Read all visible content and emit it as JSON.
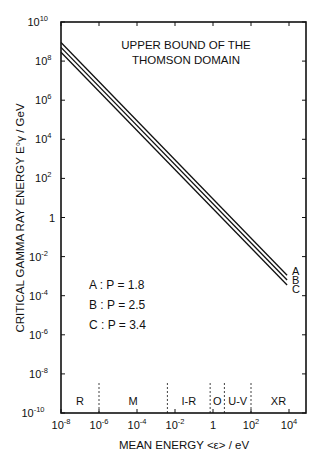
{
  "chart_data": {
    "type": "line",
    "title": "UPPER BOUND OF THE THOMSON DOMAIN",
    "title_lines": [
      "UPPER BOUND OF THE",
      "THOMSON DOMAIN"
    ],
    "xlabel": "MEAN ENERGY <ε> / eV",
    "ylabel": "CRITICAL GAMMA RAY ENERGY E°γ / GeV",
    "xscale": "log",
    "yscale": "log",
    "xlim": [
      1e-08,
      100000.0
    ],
    "ylim": [
      1e-10,
      10000000000.0
    ],
    "x_ticks": [
      {
        "exp": -8,
        "label": "10",
        "sup": "-8"
      },
      {
        "exp": -6,
        "label": "10",
        "sup": "-6"
      },
      {
        "exp": -4,
        "label": "10",
        "sup": "-4"
      },
      {
        "exp": -2,
        "label": "10",
        "sup": "-2"
      },
      {
        "exp": 0,
        "label": "1",
        "sup": ""
      },
      {
        "exp": 2,
        "label": "10",
        "sup": "2"
      },
      {
        "exp": 4,
        "label": "10",
        "sup": "4"
      }
    ],
    "y_ticks": [
      {
        "exp": 10,
        "label": "10",
        "sup": "10"
      },
      {
        "exp": 8,
        "label": "10",
        "sup": "8"
      },
      {
        "exp": 6,
        "label": "10",
        "sup": "6"
      },
      {
        "exp": 4,
        "label": "10",
        "sup": "4"
      },
      {
        "exp": 2,
        "label": "10",
        "sup": "2"
      },
      {
        "exp": 0,
        "label": "1",
        "sup": ""
      },
      {
        "exp": -2,
        "label": "10",
        "sup": "-2"
      },
      {
        "exp": -4,
        "label": "10",
        "sup": "-4"
      },
      {
        "exp": -6,
        "label": "10",
        "sup": "-6"
      },
      {
        "exp": -8,
        "label": "10",
        "sup": "-8"
      },
      {
        "exp": -10,
        "label": "10",
        "sup": "-10"
      }
    ],
    "series": [
      {
        "name": "A",
        "P": 1.8,
        "x_log10": [
          -8,
          3.9
        ],
        "y_log10": [
          8.95,
          -2.95
        ]
      },
      {
        "name": "B",
        "P": 2.5,
        "x_log10": [
          -8,
          3.9
        ],
        "y_log10": [
          8.7,
          -3.2
        ]
      },
      {
        "name": "C",
        "P": 3.4,
        "x_log10": [
          -8,
          3.9
        ],
        "y_log10": [
          8.45,
          -3.45
        ]
      }
    ],
    "legend": [
      "A : P = 1.8",
      "B : P = 2.5",
      "C : P = 3.4"
    ],
    "regions": [
      {
        "label": "R",
        "from_log10": -8,
        "to_log10": -6
      },
      {
        "label": "M",
        "from_log10": -6,
        "to_log10": -2.4
      },
      {
        "label": "I-R",
        "from_log10": -2.4,
        "to_log10": -0.15
      },
      {
        "label": "O",
        "from_log10": -0.15,
        "to_log10": 0.6
      },
      {
        "label": "U-V",
        "from_log10": 0.6,
        "to_log10": 2
      },
      {
        "label": "XR",
        "from_log10": 2,
        "to_log10": 5
      }
    ],
    "grid": false
  }
}
